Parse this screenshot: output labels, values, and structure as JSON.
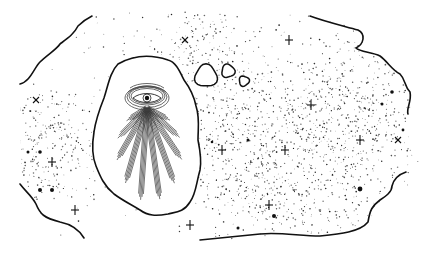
{
  "illustration": {
    "subject": "radiant eye in a cloud amid a starfield",
    "background": "#ffffff",
    "ink": "#111111",
    "stipple_color": "#1a1a1a",
    "cloud_fill": "#ffffff",
    "ray_color": "#333333",
    "stars_plus": [
      {
        "x": 289,
        "y": 40
      },
      {
        "x": 311,
        "y": 105
      },
      {
        "x": 52,
        "y": 162
      },
      {
        "x": 75,
        "y": 210
      },
      {
        "x": 222,
        "y": 150
      },
      {
        "x": 285,
        "y": 150
      },
      {
        "x": 269,
        "y": 205
      },
      {
        "x": 190,
        "y": 225
      },
      {
        "x": 360,
        "y": 140
      }
    ],
    "stars_cross": [
      {
        "x": 185,
        "y": 40
      },
      {
        "x": 36,
        "y": 100
      },
      {
        "x": 398,
        "y": 140
      }
    ],
    "stars_dot": [
      {
        "x": 40,
        "y": 152,
        "r": 1.8
      },
      {
        "x": 28,
        "y": 152,
        "r": 1.5
      },
      {
        "x": 40,
        "y": 190,
        "r": 2
      },
      {
        "x": 52,
        "y": 190,
        "r": 2
      },
      {
        "x": 248,
        "y": 140,
        "r": 1.5
      },
      {
        "x": 274,
        "y": 216,
        "r": 2
      },
      {
        "x": 238,
        "y": 228,
        "r": 1.5
      },
      {
        "x": 360,
        "y": 189,
        "r": 2.4
      },
      {
        "x": 392,
        "y": 92,
        "r": 1.8
      },
      {
        "x": 382,
        "y": 104,
        "r": 1.5
      },
      {
        "x": 403,
        "y": 130,
        "r": 1.4
      },
      {
        "x": 212,
        "y": 142,
        "r": 1.3
      }
    ],
    "bubbles": [
      {
        "cx": 206,
        "cy": 76,
        "r": 11
      },
      {
        "cx": 228,
        "cy": 71,
        "r": 6.5
      },
      {
        "cx": 244,
        "cy": 81,
        "r": 5
      }
    ],
    "stipple_seed": 7,
    "stipple_count": 5200
  }
}
